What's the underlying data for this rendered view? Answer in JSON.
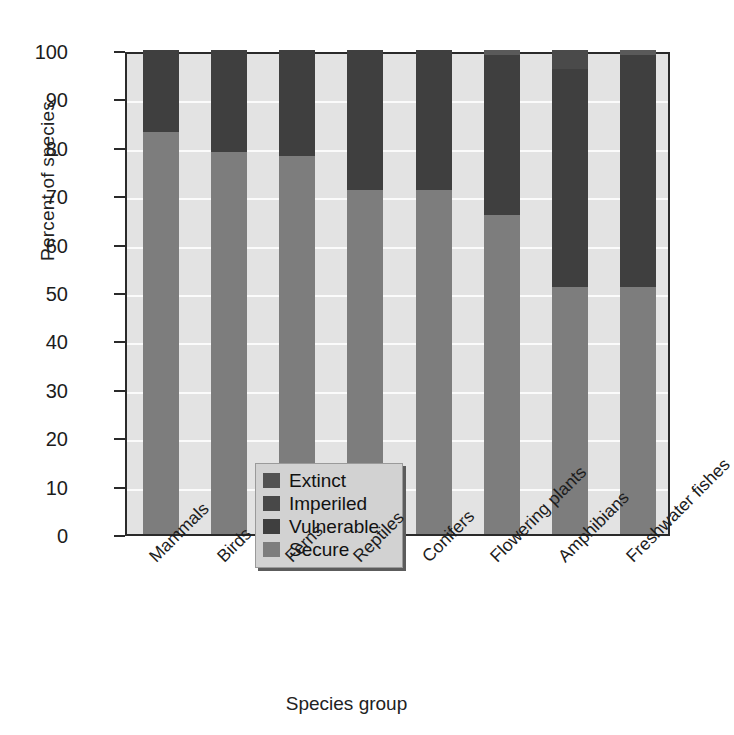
{
  "chart_data": {
    "type": "bar",
    "subtype": "stacked-percentage",
    "title": "",
    "xlabel": "Species group",
    "ylabel": "Percent of species",
    "ylim": [
      0,
      100
    ],
    "yticks": [
      0,
      10,
      20,
      30,
      40,
      50,
      60,
      70,
      80,
      90,
      100
    ],
    "ytick_labels": [
      "0",
      "10",
      "20",
      "30",
      "40",
      "50",
      "60",
      "70",
      "80",
      "90",
      "100"
    ],
    "grid": true,
    "legend_position": "inside-lower-left",
    "categories": [
      "Mammals",
      "Birds",
      "Ferns",
      "Reptiles",
      "Conifers",
      "Flowering plants",
      "Amphibians",
      "Freshwater fishes"
    ],
    "series": [
      {
        "name": "Secure",
        "color": "#7d7d7d",
        "values": [
          83,
          79,
          78,
          71,
          71,
          66,
          51,
          51
        ]
      },
      {
        "name": "Vulnerable",
        "color": "#3f3f3f",
        "values": [
          17,
          21,
          22,
          29,
          29,
          33,
          45,
          48
        ]
      },
      {
        "name": "Imperiled",
        "color": "#4a4a4a",
        "values": [
          0,
          0,
          0,
          0,
          0,
          0,
          4,
          0
        ]
      },
      {
        "name": "Extinct",
        "color": "#5a5a5a",
        "values": [
          0,
          0,
          0,
          0,
          0,
          1,
          0,
          1
        ]
      }
    ],
    "stack_order_bottom_to_top": [
      "Secure",
      "Vulnerable",
      "Imperiled",
      "Extinct"
    ]
  },
  "legend": {
    "items": [
      {
        "label": "Extinct",
        "color": "#525252"
      },
      {
        "label": "Imperiled",
        "color": "#484848"
      },
      {
        "label": "Vulnerable",
        "color": "#3f3f3f"
      },
      {
        "label": "Secure",
        "color": "#7d7d7d"
      }
    ]
  },
  "colors": {
    "plot_background": "#e3e3e3",
    "gridline": "#fbfbfb",
    "axis": "#2a2a2a",
    "page_background": "#ffffff",
    "legend_background": "#d2d2d2"
  }
}
